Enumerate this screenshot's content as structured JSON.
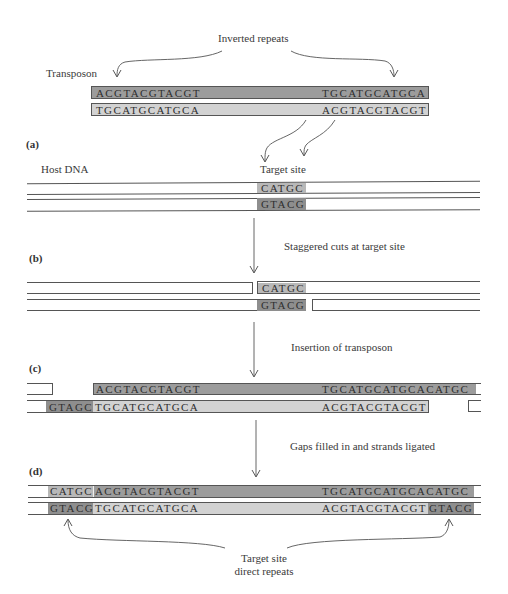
{
  "labels": {
    "inverted_repeats": "Inverted repeats",
    "transposon": "Transposon",
    "host_dna": "Host DNA",
    "target_site": "Target site",
    "step_b": "Staggered cuts at target site",
    "step_c": "Insertion of transposon",
    "step_d": "Gaps filled in and strands ligated",
    "direct_repeats_line1": "Target site",
    "direct_repeats_line2": "direct repeats"
  },
  "panels": {
    "a": "(a)",
    "b": "(b)",
    "c": "(c)",
    "d": "(d)"
  },
  "transposon": {
    "top_left": "ACGTACGTACGT",
    "top_right": "TGCATGCATGCA",
    "bottom_left": "TGCATGCATGCA",
    "bottom_right": "ACGTACGTACGT"
  },
  "host": {
    "target_top": "CATGC",
    "target_bottom": "GTACG"
  },
  "cut": {
    "target_top": "CATGC",
    "target_bottom": "GTACG"
  },
  "insertion": {
    "top_left": "ACGTACGTACGT",
    "top_right": "TGCATGCATGCACATGC",
    "bottom_overhang": "GTAGC",
    "bottom_left": "TGCATGCATGCA",
    "bottom_right": "ACGTACGTACGT"
  },
  "ligated": {
    "top_repeat": "CATGC",
    "top_left": "ACGTACGTACGT",
    "top_right": "TGCATGCATGCACATGC",
    "bottom_repeat": "GTACG",
    "bottom_left": "TGCATGCATGCA",
    "bottom_right": "ACGTACGTACGT",
    "bottom_right_repeat": "GTACG"
  },
  "colors": {
    "dark_strand": "#9c9c9c",
    "light_strand": "#d2d2d2",
    "target_dark": "#8e8e8e",
    "line": "#555555"
  }
}
